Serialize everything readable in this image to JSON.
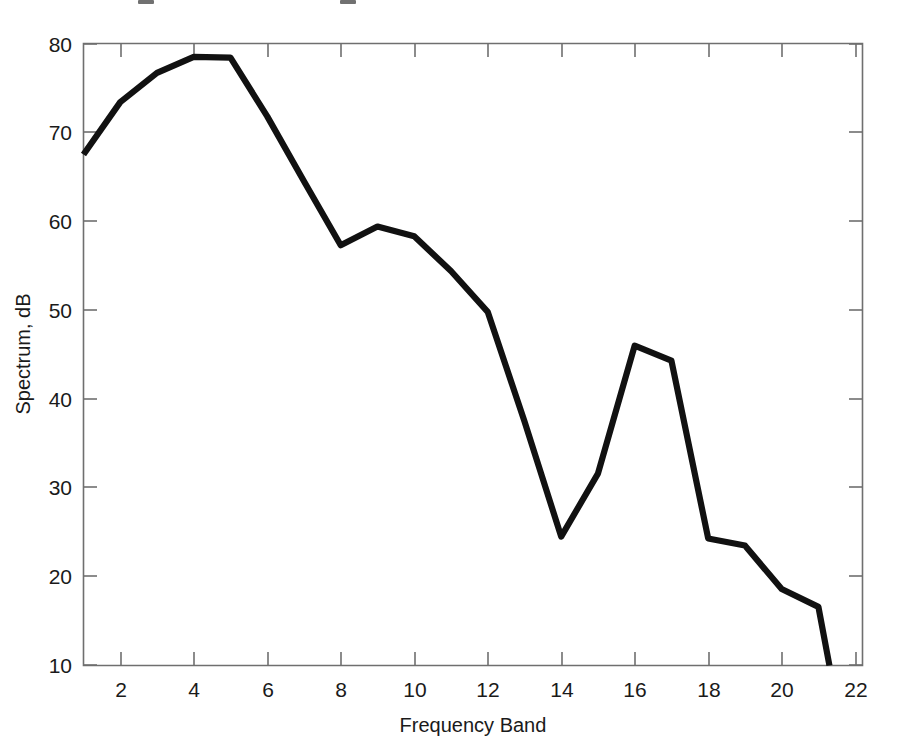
{
  "figure": {
    "background_color": "#ffffff",
    "line_color": "#111111",
    "axis_color": "#6f6f6f",
    "text_color": "#1a1a1a"
  },
  "chart_data": {
    "type": "line",
    "title": "",
    "xlabel": "Frequency Band",
    "ylabel": "Spectrum, dB",
    "xlim": [
      1,
      22.2
    ],
    "ylim": [
      10,
      80
    ],
    "grid": false,
    "legend": "none",
    "xticks": [
      2,
      4,
      6,
      8,
      10,
      12,
      14,
      16,
      18,
      20,
      22
    ],
    "xtick_labels": [
      "2",
      "4",
      "6",
      "8",
      "10",
      "12",
      "14",
      "16",
      "18",
      "20",
      "22"
    ],
    "yticks": [
      10,
      20,
      30,
      40,
      50,
      60,
      70,
      80
    ],
    "ytick_labels": [
      "10",
      "20",
      "30",
      "40",
      "50",
      "60",
      "70",
      "80"
    ],
    "series": [
      {
        "name": "spectrum",
        "x": [
          1,
          2,
          3,
          4,
          5,
          6,
          7,
          8,
          9,
          10,
          11,
          12,
          13,
          14,
          15,
          16,
          17,
          18,
          19,
          20,
          21,
          21.3
        ],
        "values": [
          67.5,
          73.4,
          76.7,
          78.5,
          78.4,
          71.8,
          64.5,
          57.3,
          59.4,
          58.3,
          54.4,
          49.8,
          37.5,
          24.5,
          31.6,
          46.0,
          44.3,
          24.3,
          23.5,
          18.6,
          16.6,
          10.0
        ]
      }
    ]
  }
}
